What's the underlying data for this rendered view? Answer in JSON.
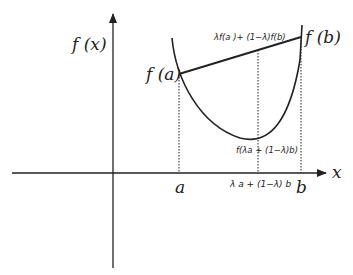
{
  "diagram": {
    "colors": {
      "ink": "#222222",
      "background": "#ffffff"
    },
    "axes": {
      "y_label": "f (x)",
      "x_label": "x"
    },
    "points": {
      "a_label": "a",
      "b_label": "b",
      "mid_label": "λ a + (1−λ) b",
      "fa_label": "f (a)",
      "fb_label": "f (b)"
    },
    "annotations": {
      "chord_label": "λf(a )+ (1−λ)f(b)",
      "curve_value_label": "f(λa + (1−λ)b)"
    }
  }
}
